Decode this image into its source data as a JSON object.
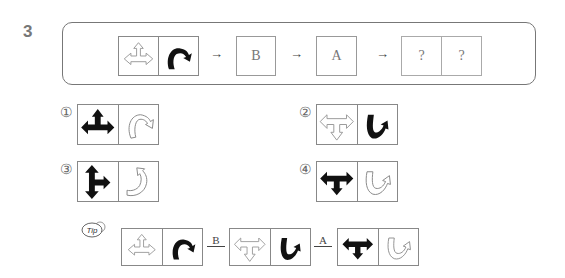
{
  "question": {
    "number": "3",
    "sequence": {
      "start_pair": {
        "left_icon": "outline-three-way-arrow-up-left-right",
        "right_icon": "black-curved-arrow-right"
      },
      "arrow1": "→",
      "step1_label": "B",
      "arrow2": "→",
      "step2_label": "A",
      "arrow3": "→",
      "result_labels": [
        "?",
        "?"
      ]
    }
  },
  "options": [
    {
      "marker": "①",
      "left_icon": "black-three-way-arrow-up-left-right",
      "right_icon": "outline-curved-arrow-right"
    },
    {
      "marker": "②",
      "left_icon": "outline-three-way-arrow-down-left-right",
      "right_icon": "black-curved-arrow-up"
    },
    {
      "marker": "③",
      "left_icon": "black-three-way-arrow-up-down-right",
      "right_icon": "outline-curved-arrow-up"
    },
    {
      "marker": "④",
      "left_icon": "black-three-way-arrow-down-left-right",
      "right_icon": "outline-curved-arrow-up-right"
    }
  ],
  "tip": {
    "badge": "Tip",
    "step1_label": "B",
    "step2_label": "A"
  },
  "colors": {
    "border": "#888888",
    "text": "#333333",
    "number": "#777777"
  }
}
